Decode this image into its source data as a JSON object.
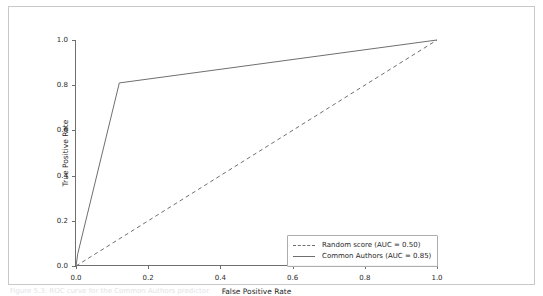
{
  "figure": {
    "caption_partial": "Figure 5.3: ROC curve for the Common Authors predictor"
  },
  "chart_data": {
    "type": "line",
    "title": "",
    "xlabel": "False Positive Rate",
    "ylabel": "True Positive Rate",
    "xlim": [
      0.0,
      1.0
    ],
    "ylim": [
      0.0,
      1.0
    ],
    "xticks": [
      "0.0",
      "0.2",
      "0.4",
      "0.6",
      "0.8",
      "1.0"
    ],
    "xtick_values": [
      0.0,
      0.2,
      0.4,
      0.6,
      0.8,
      1.0
    ],
    "yticks": [
      "0.0",
      "0.2",
      "0.4",
      "0.6",
      "0.8",
      "1.0"
    ],
    "ytick_values": [
      0.0,
      0.2,
      0.4,
      0.6,
      0.8,
      1.0
    ],
    "grid": false,
    "legend_position": "lower right",
    "line_color": "#6f6f6f",
    "series": [
      {
        "name": "Random score (AUC = 0.50)",
        "style": "dashed",
        "auc": 0.5,
        "x": [
          0.0,
          1.0
        ],
        "y": [
          0.0,
          1.0
        ]
      },
      {
        "name": "Common Authors (AUC = 0.85)",
        "style": "solid",
        "auc": 0.85,
        "x": [
          0.0,
          0.005,
          0.12,
          1.0,
          1.0
        ],
        "y": [
          0.0,
          0.055,
          0.81,
          1.0,
          1.0
        ]
      }
    ]
  },
  "legend": {
    "entries": [
      {
        "label": "Random score (AUC = 0.50)",
        "style": "dashed"
      },
      {
        "label": "Common Authors (AUC = 0.85)",
        "style": "solid"
      }
    ]
  }
}
